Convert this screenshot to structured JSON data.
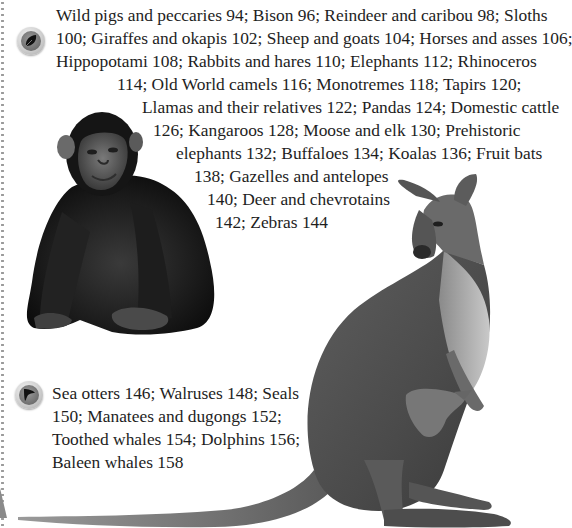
{
  "page": {
    "section_land": {
      "icon": "leaf-icon",
      "lines": [
        "Wild pigs and peccaries 94; Bison 96; Reindeer and caribou 98; Sloths",
        "100; Giraffes and okapis 102; Sheep and goats 104; Horses and asses 106;",
        "Hippopotami 108; Rabbits and hares 110; Elephants 112; Rhinoceros",
        "114; Old World camels 116; Monotremes 118; Tapirs 120;",
        "Llamas and their relatives 122; Pandas 124; Domestic cattle",
        "126; Kangaroos 128; Moose and elk 130; Prehistoric",
        "elephants 132; Buffaloes 134; Koalas 136; Fruit bats",
        "138; Gazelles and antelopes",
        "140; Deer and chevrotains",
        "142; Zebras 144"
      ]
    },
    "section_sea": {
      "icon": "dolphin-fin-icon",
      "lines": [
        "Sea otters 146; Walruses 148; Seals",
        "150; Manatees and dugongs 152;",
        "Toothed whales 154; Dolphins 156;",
        "Baleen whales 158"
      ]
    },
    "illustrations": {
      "left": "chimpanzee",
      "right": "kangaroo-with-joey"
    }
  }
}
